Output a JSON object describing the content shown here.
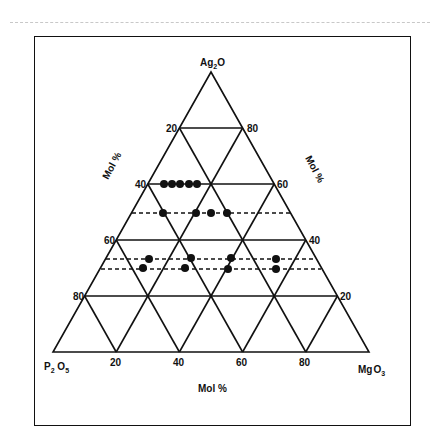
{
  "diagram": {
    "type": "ternary",
    "vertices": {
      "top": "Ag2O",
      "bottom_left": "P2O5",
      "bottom_right": "MgO3"
    },
    "vertex_labels": {
      "top": {
        "main": "Ag",
        "sub": "2",
        "tail": "O"
      },
      "bottom_left": {
        "main": "P",
        "sub": "2",
        "mid": " O",
        "sub2": "5"
      },
      "bottom_right": {
        "main": "Mg",
        "mid": "O",
        "sub": "3"
      }
    },
    "left_axis_ticks": [
      "20",
      "40",
      "60",
      "80"
    ],
    "right_axis_ticks": [
      "80",
      "60",
      "40",
      "20"
    ],
    "bottom_axis_ticks": [
      "20",
      "40",
      "60",
      "80"
    ],
    "left_axis_label": "Mol %",
    "right_axis_label": "Mol %",
    "bottom_axis_label": "Mol %"
  },
  "chart_data": {
    "type": "scatter",
    "subtype": "ternary",
    "title": "",
    "components": [
      "Ag2O",
      "P2O5",
      "MgO3"
    ],
    "axis_labels": {
      "left": "Mol %",
      "right": "Mol %",
      "bottom": "Mol %"
    },
    "grid": {
      "step": 20,
      "on": true
    },
    "dashed_lines_Ag2O_mol_pct": [
      50,
      33,
      30
    ],
    "points": [
      {
        "Ag2O": 60,
        "P2O5": 35,
        "MgO3": 5
      },
      {
        "Ag2O": 60,
        "P2O5": 32.5,
        "MgO3": 7.5
      },
      {
        "Ag2O": 60,
        "P2O5": 30,
        "MgO3": 10
      },
      {
        "Ag2O": 60,
        "P2O5": 27,
        "MgO3": 13
      },
      {
        "Ag2O": 60,
        "P2O5": 24.5,
        "MgO3": 15.5
      },
      {
        "Ag2O": 50,
        "P2O5": 40,
        "MgO3": 10
      },
      {
        "Ag2O": 50,
        "P2O5": 30,
        "MgO3": 20
      },
      {
        "Ag2O": 50,
        "P2O5": 25,
        "MgO3": 25
      },
      {
        "Ag2O": 50,
        "P2O5": 20,
        "MgO3": 30
      },
      {
        "Ag2O": 33,
        "P2O5": 52,
        "MgO3": 15
      },
      {
        "Ag2O": 33,
        "P2O5": 39,
        "MgO3": 28
      },
      {
        "Ag2O": 33,
        "P2O5": 27,
        "MgO3": 40
      },
      {
        "Ag2O": 33,
        "P2O5": 12,
        "MgO3": 55
      },
      {
        "Ag2O": 30,
        "P2O5": 55,
        "MgO3": 15
      },
      {
        "Ag2O": 30,
        "P2O5": 42,
        "MgO3": 28
      },
      {
        "Ag2O": 30,
        "P2O5": 28,
        "MgO3": 42
      },
      {
        "Ag2O": 30,
        "P2O5": 14,
        "MgO3": 56
      }
    ]
  },
  "plot_points_px": [
    {
      "x": 164,
      "y": 184
    },
    {
      "x": 172,
      "y": 184
    },
    {
      "x": 180,
      "y": 184
    },
    {
      "x": 189,
      "y": 184
    },
    {
      "x": 197,
      "y": 184
    },
    {
      "x": 163,
      "y": 213
    },
    {
      "x": 196,
      "y": 213
    },
    {
      "x": 211,
      "y": 213
    },
    {
      "x": 227,
      "y": 213
    },
    {
      "x": 149,
      "y": 259
    },
    {
      "x": 191,
      "y": 258
    },
    {
      "x": 231,
      "y": 258
    },
    {
      "x": 276,
      "y": 259
    },
    {
      "x": 143,
      "y": 268
    },
    {
      "x": 185,
      "y": 268
    },
    {
      "x": 228,
      "y": 269
    },
    {
      "x": 276,
      "y": 269
    }
  ]
}
